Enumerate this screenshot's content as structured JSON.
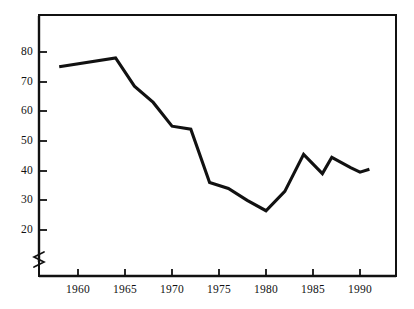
{
  "chart_data": {
    "type": "line",
    "title": "",
    "subtitle": "",
    "xlabel": "",
    "ylabel": "",
    "xlim": [
      1957.5,
      1991.5
    ],
    "ylim": [
      15,
      85
    ],
    "yaxis_break": true,
    "grid": false,
    "legend": null,
    "axis_color": "#111111",
    "line_color": "#111111",
    "background": "#ffffff",
    "x_ticks": [
      1960,
      1965,
      1970,
      1975,
      1980,
      1985,
      1990
    ],
    "x_tick_labels": [
      "1960",
      "1965",
      "1970",
      "1975",
      "1980",
      "1985",
      "1990"
    ],
    "y_ticks": [
      20,
      30,
      40,
      50,
      60,
      70,
      80
    ],
    "y_tick_labels": [
      "20",
      "30",
      "40",
      "50",
      "60",
      "70",
      "80"
    ],
    "x": [
      1958,
      1964,
      1966,
      1968,
      1970,
      1972,
      1974,
      1976,
      1978,
      1980,
      1982,
      1984,
      1986,
      1987,
      1989,
      1990,
      1991
    ],
    "values": [
      75,
      78,
      68.5,
      63,
      55,
      54,
      36,
      34,
      30,
      26.5,
      33,
      45.5,
      39,
      44.5,
      41,
      39.5,
      40.5
    ],
    "series": [
      {
        "name": "series-1",
        "x": [
          1958,
          1964,
          1966,
          1968,
          1970,
          1972,
          1974,
          1976,
          1978,
          1980,
          1982,
          1984,
          1986,
          1987,
          1989,
          1990,
          1991
        ],
        "values": [
          75,
          78,
          68.5,
          63,
          55,
          54,
          36,
          34,
          30,
          26.5,
          33,
          45.5,
          39,
          44.5,
          41,
          39.5,
          40.5
        ]
      }
    ],
    "annotations": []
  },
  "axis": {
    "y_labels": [
      "80",
      "70",
      "60",
      "50",
      "40",
      "30",
      "20"
    ],
    "x_labels": [
      "1960",
      "1965",
      "1970",
      "1975",
      "1980",
      "1985",
      "1990"
    ],
    "break_symbol": "axis-break"
  }
}
